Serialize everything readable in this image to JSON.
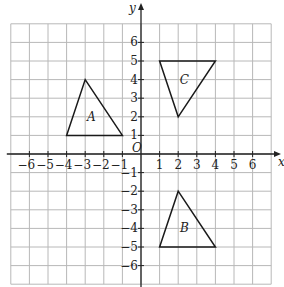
{
  "diagram": {
    "type": "coordinate-grid",
    "x_axis_label": "x",
    "y_axis_label": "y",
    "origin_label": "O",
    "x_range": [
      -7,
      7
    ],
    "y_range": [
      -7,
      7
    ],
    "x_ticks_labels": [
      "−6",
      "−5",
      "−4",
      "−3",
      "−2",
      "−1",
      "1",
      "2",
      "3",
      "4",
      "5",
      "6"
    ],
    "y_ticks_labels": [
      "6",
      "5",
      "4",
      "3",
      "2",
      "1",
      "−1",
      "−2",
      "−3",
      "−4",
      "−5",
      "−6"
    ],
    "colors": {
      "grid": "#b8b8b8",
      "axis": "#222222",
      "shape": "#1a1a1a"
    },
    "triangles": [
      {
        "label": "A",
        "vertices": [
          [
            -4,
            1
          ],
          [
            -3,
            4
          ],
          [
            -1,
            1
          ]
        ]
      },
      {
        "label": "B",
        "vertices": [
          [
            1,
            -5
          ],
          [
            2,
            -2
          ],
          [
            4,
            -5
          ]
        ]
      },
      {
        "label": "C",
        "vertices": [
          [
            1,
            5
          ],
          [
            4,
            5
          ],
          [
            2,
            2
          ]
        ]
      }
    ]
  }
}
